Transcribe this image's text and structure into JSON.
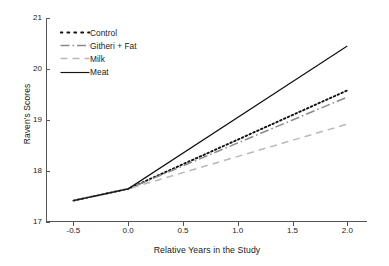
{
  "chart_data": {
    "type": "line",
    "title": "",
    "xlabel": "Relative Years in the Study",
    "ylabel": "Raven's Scores",
    "xlim": [
      -0.75,
      2.18
    ],
    "ylim": [
      17,
      21
    ],
    "xticks": [
      -0.5,
      0.0,
      0.5,
      1.0,
      1.5,
      2.0
    ],
    "xticklabels": [
      "-0.5",
      "0.0",
      "0.5",
      "1.0",
      "1.5",
      "2.0"
    ],
    "yticks": [
      17,
      18,
      19,
      20,
      21
    ],
    "yticklabels": [
      "17",
      "18",
      "19",
      "20",
      "21"
    ],
    "grid": false,
    "legend_position": "upper left",
    "x": [
      -0.5,
      0.0,
      2.0
    ],
    "series": [
      {
        "name": "Control",
        "values": [
          17.42,
          17.65,
          19.58
        ],
        "color": "#111111",
        "linestyle": "dotted"
      },
      {
        "name": "Githeri + Fat",
        "values": [
          17.42,
          17.65,
          19.45
        ],
        "color": "#8a8a8a",
        "linestyle": "dashdot"
      },
      {
        "name": "Milk",
        "values": [
          17.42,
          17.65,
          18.92
        ],
        "color": "#b8b8b8",
        "linestyle": "dashed"
      },
      {
        "name": "Meat",
        "values": [
          17.42,
          17.65,
          20.45
        ],
        "color": "#111111",
        "linestyle": "solid"
      }
    ]
  },
  "legend": {
    "items": [
      {
        "label": "Control"
      },
      {
        "label": "Githeri + Fat"
      },
      {
        "label": "Milk"
      },
      {
        "label": "Meat"
      }
    ]
  }
}
